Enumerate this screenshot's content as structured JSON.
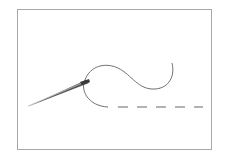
{
  "illustration": {
    "subject": "needle-and-thread",
    "colors": {
      "frame": "#a8a8a8",
      "thread": "#6e6e6e",
      "needle": "#555555",
      "needle_highlight": "#bdbdbd"
    },
    "stitch_dashes": 5
  }
}
